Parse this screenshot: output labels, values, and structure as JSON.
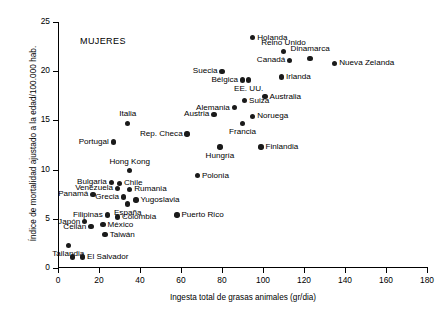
{
  "panel": {
    "title": "MUJERES"
  },
  "chart_data": {
    "type": "scatter",
    "title": "MUJERES",
    "xlabel": "Ingesta total de grasas animales (gr/dia)",
    "ylabel": "Índice de mortalidad ajustado a la edad/100.000 hab.",
    "xlim": [
      0,
      180
    ],
    "ylim": [
      0,
      25
    ],
    "xticks": [
      0,
      20,
      40,
      60,
      80,
      100,
      120,
      140,
      160,
      180
    ],
    "yticks": [
      0,
      5,
      10,
      15,
      20,
      25
    ],
    "grid": false,
    "legend": "none",
    "points": [
      {
        "label": "Holanda",
        "x": 95,
        "y": 23.4,
        "label_pos": "right"
      },
      {
        "label": "Reino Unido",
        "x": 110,
        "y": 22.0,
        "label_pos": "above"
      },
      {
        "label": "Dinamarca",
        "x": 123,
        "y": 21.3,
        "label_pos": "above"
      },
      {
        "label": "Canadá",
        "x": 113,
        "y": 21.1,
        "label_pos": "left"
      },
      {
        "label": "Nueva Zelanda",
        "x": 135,
        "y": 20.8,
        "label_pos": "right"
      },
      {
        "label": "Suecia",
        "x": 80,
        "y": 20.0,
        "label_pos": "left"
      },
      {
        "label": "Irlanda",
        "x": 109,
        "y": 19.4,
        "label_pos": "right"
      },
      {
        "label": "Bélgica",
        "x": 90,
        "y": 19.1,
        "label_pos": "left"
      },
      {
        "label": "EE. UU.",
        "x": 93,
        "y": 19.1,
        "label_pos": "below"
      },
      {
        "label": "Australia",
        "x": 101,
        "y": 17.4,
        "label_pos": "right"
      },
      {
        "label": "Suiza",
        "x": 91,
        "y": 17.0,
        "label_pos": "right"
      },
      {
        "label": "Alemania",
        "x": 86,
        "y": 16.3,
        "label_pos": "left"
      },
      {
        "label": "Austria",
        "x": 76,
        "y": 15.6,
        "label_pos": "left"
      },
      {
        "label": "Noruega",
        "x": 95,
        "y": 15.4,
        "label_pos": "right"
      },
      {
        "label": "Italia",
        "x": 34,
        "y": 14.7,
        "label_pos": "above"
      },
      {
        "label": "Francia",
        "x": 90,
        "y": 14.7,
        "label_pos": "below"
      },
      {
        "label": "Rep. Checa",
        "x": 63,
        "y": 13.6,
        "label_pos": "left"
      },
      {
        "label": "Portugal",
        "x": 27,
        "y": 12.8,
        "label_pos": "left"
      },
      {
        "label": "Hungría",
        "x": 79,
        "y": 12.3,
        "label_pos": "below"
      },
      {
        "label": "Finlandia",
        "x": 99,
        "y": 12.3,
        "label_pos": "right"
      },
      {
        "label": "Hong Kong",
        "x": 35,
        "y": 9.9,
        "label_pos": "above"
      },
      {
        "label": "Polonia",
        "x": 68,
        "y": 9.4,
        "label_pos": "right"
      },
      {
        "label": "Bulgaria",
        "x": 26,
        "y": 8.7,
        "label_pos": "left"
      },
      {
        "label": "Chile",
        "x": 30,
        "y": 8.6,
        "label_pos": "right"
      },
      {
        "label": "Venezuela",
        "x": 29,
        "y": 8.1,
        "label_pos": "left"
      },
      {
        "label": "Rumania",
        "x": 35,
        "y": 8.0,
        "label_pos": "right"
      },
      {
        "label": "Panamá",
        "x": 17,
        "y": 7.5,
        "label_pos": "left"
      },
      {
        "label": "Grecia",
        "x": 32,
        "y": 7.2,
        "label_pos": "left"
      },
      {
        "label": "Yugoslavia",
        "x": 38,
        "y": 6.9,
        "label_pos": "right"
      },
      {
        "label": "España",
        "x": 34,
        "y": 6.5,
        "label_pos": "below"
      },
      {
        "label": "Filipinas",
        "x": 24,
        "y": 5.4,
        "label_pos": "left"
      },
      {
        "label": "Colombia",
        "x": 29,
        "y": 5.2,
        "label_pos": "right"
      },
      {
        "label": "Puerto Rico",
        "x": 58,
        "y": 5.4,
        "label_pos": "right"
      },
      {
        "label": "Japón",
        "x": 13,
        "y": 4.7,
        "label_pos": "left"
      },
      {
        "label": "México",
        "x": 22,
        "y": 4.4,
        "label_pos": "right"
      },
      {
        "label": "Ceilán",
        "x": 16,
        "y": 4.2,
        "label_pos": "left"
      },
      {
        "label": "Taiwán",
        "x": 23,
        "y": 3.4,
        "label_pos": "right"
      },
      {
        "label": "Tailandia",
        "x": 5,
        "y": 2.3,
        "label_pos": "below"
      },
      {
        "label": "El Salvador",
        "x": 12,
        "y": 1.1,
        "label_pos": "right"
      },
      {
        "label": "",
        "x": 7,
        "y": 1.1,
        "label_pos": "none"
      }
    ]
  }
}
